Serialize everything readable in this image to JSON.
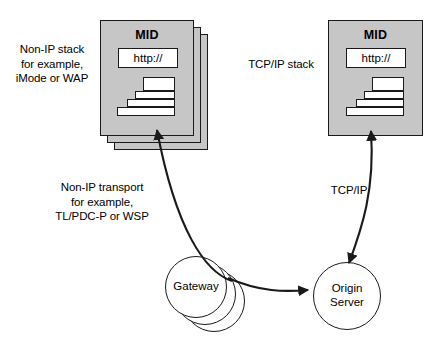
{
  "diagram": {
    "background_color": "#ffffff",
    "card_fill": "#c6c6c6",
    "stroke_color": "#1a1a1a"
  },
  "labels": {
    "nonip_stack": "Non-IP stack\nfor example,\niMode or WAP",
    "tcpip_stack": "TCP/IP stack",
    "nonip_transport": "Non-IP transport\nfor example,\nTL/PDC-P or WSP",
    "tcpip_transport": "TCP/IP"
  },
  "nodes": {
    "mid_left": {
      "title": "MID",
      "url": "http://",
      "stack_count": 3,
      "protocol_bars": 4
    },
    "mid_right": {
      "title": "MID",
      "url": "http://",
      "stack_count": 1,
      "protocol_bars": 4
    },
    "gateway": {
      "label": "Gateway",
      "circle_count": 3
    },
    "origin_server": {
      "label": "Origin\nServer"
    }
  },
  "connections": [
    {
      "name": "gateway-to-mid-left",
      "transport": "Non-IP transport",
      "arrow": "to-mid"
    },
    {
      "name": "gateway-to-origin-server",
      "transport": "IP",
      "arrow": "to-origin"
    },
    {
      "name": "mid-right-to-origin-server",
      "transport": "TCP/IP",
      "arrow": "both"
    }
  ]
}
